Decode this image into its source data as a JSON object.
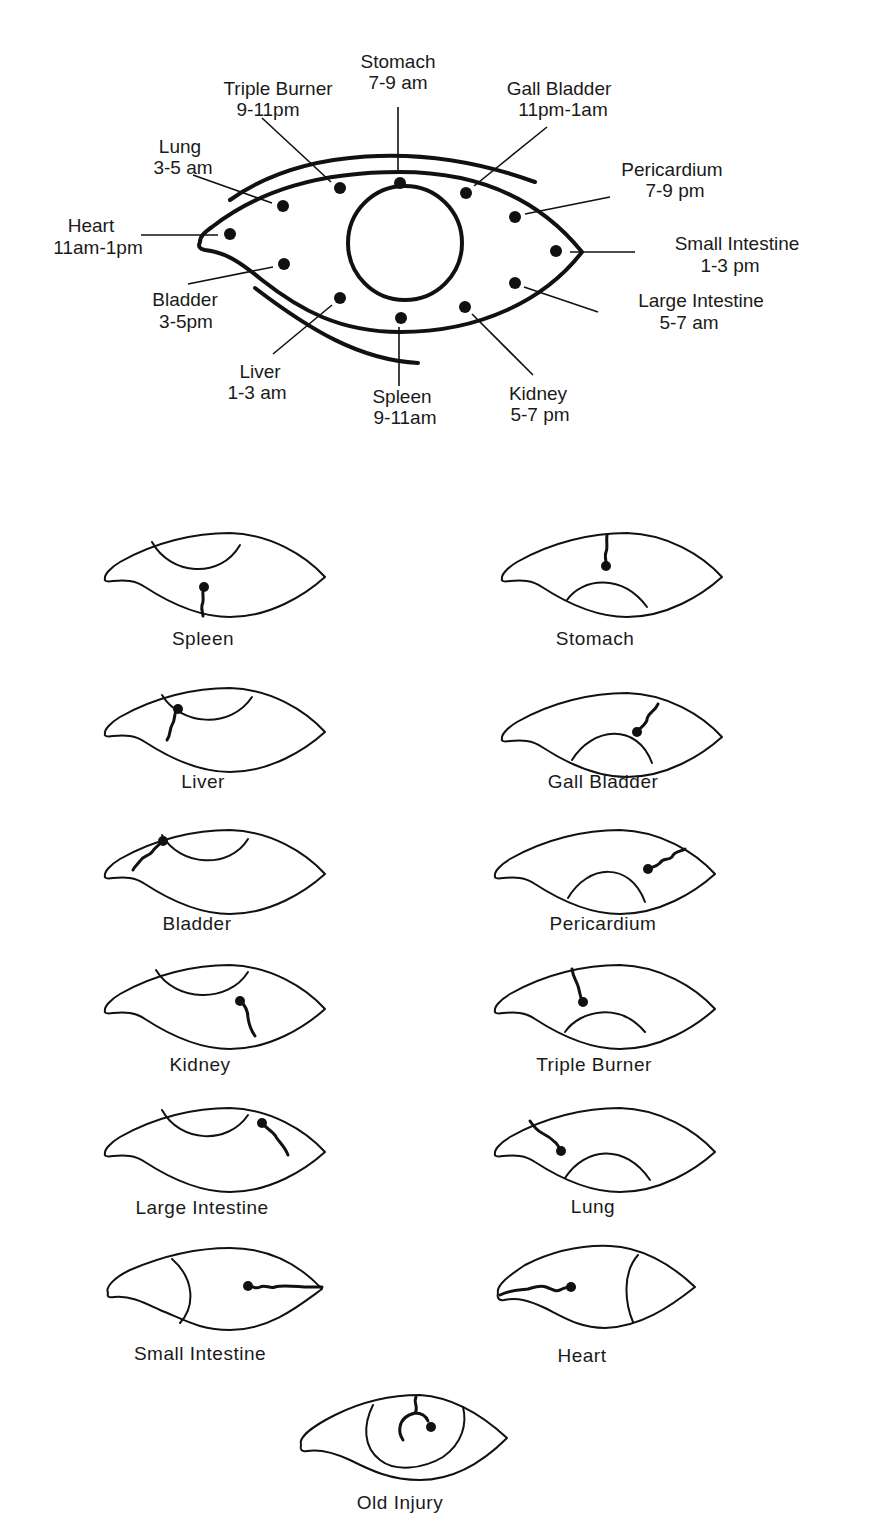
{
  "main_chart": {
    "meridians": [
      {
        "organ": "Stomach",
        "time": "7-9 am"
      },
      {
        "organ": "Triple Burner",
        "time": "9-11pm"
      },
      {
        "organ": "Gall Bladder",
        "time": "11pm-1am"
      },
      {
        "organ": "Lung",
        "time": "3-5 am"
      },
      {
        "organ": "Pericardium",
        "time": "7-9 pm"
      },
      {
        "organ": "Heart",
        "time": "11am-1pm"
      },
      {
        "organ": "Small Intestine",
        "time": "1-3 pm"
      },
      {
        "organ": "Bladder",
        "time": "3-5pm"
      },
      {
        "organ": "Large Intestine",
        "time": "5-7 am"
      },
      {
        "organ": "Liver",
        "time": "1-3 am"
      },
      {
        "organ": "Spleen",
        "time": "9-11am"
      },
      {
        "organ": "Kidney",
        "time": "5-7 pm"
      }
    ]
  },
  "examples": [
    {
      "label": "Spleen"
    },
    {
      "label": "Stomach"
    },
    {
      "label": "Liver"
    },
    {
      "label": "Gall Bladder"
    },
    {
      "label": "Bladder"
    },
    {
      "label": "Pericardium"
    },
    {
      "label": "Kidney"
    },
    {
      "label": "Triple Burner"
    },
    {
      "label": "Large Intestine"
    },
    {
      "label": "Lung"
    },
    {
      "label": "Small Intestine"
    },
    {
      "label": "Heart"
    },
    {
      "label": "Old Injury"
    }
  ],
  "colors": {
    "ink": "#111111",
    "background": "#ffffff"
  }
}
